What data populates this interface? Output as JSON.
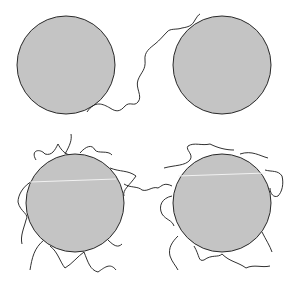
{
  "diagram": {
    "colors": {
      "particle_fill": "#c4c4c4",
      "particle_stroke": "#2a2a2a",
      "chain_stroke": "#1a1a1a",
      "highlight": "#f2f2f2",
      "background": "#ffffff"
    },
    "panels": [
      {
        "name": "top",
        "particles": [
          {
            "cx": 66,
            "cy": 65,
            "r": 49
          },
          {
            "cx": 222,
            "cy": 65,
            "r": 49
          }
        ],
        "chains": "single bridging chain"
      },
      {
        "name": "bottom",
        "particles": [
          {
            "cx": 75,
            "cy": 203,
            "r": 49
          },
          {
            "cx": 222,
            "cy": 203,
            "r": 49
          }
        ],
        "chains": "many adsorbed chains"
      }
    ],
    "caption": ""
  }
}
